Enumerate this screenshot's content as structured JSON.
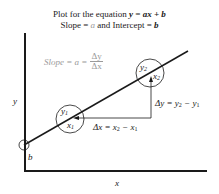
{
  "title": {
    "line1_prefix": "Plot for the equation ",
    "line1_equation": "y = ax + b",
    "line2_prefix": "Slope = ",
    "line2_a": "a",
    "line2_middle": " and Intercept = ",
    "line2_b": "b"
  },
  "slope_label": {
    "prefix": "Slope = a =",
    "numerator": "Δy",
    "denominator": "Δx"
  },
  "axes": {
    "x_label": "x",
    "y_label": "y"
  },
  "points": {
    "p1": {
      "y": "y",
      "y_sub": "1",
      "x": "x",
      "x_sub": "1"
    },
    "p2": {
      "y": "y",
      "y_sub": "2",
      "x": "x",
      "x_sub": "2"
    }
  },
  "intercept_label": "b",
  "delta_x": {
    "lhs": "Δx = x",
    "sub2": "2",
    "mid": " − x",
    "sub1": "1"
  },
  "delta_y": {
    "lhs": "Δy = y",
    "sub2": "2",
    "mid": " − y",
    "sub1": "1"
  },
  "colors": {
    "ink": "#1a1a1a",
    "gray_text": "#9a9a9a"
  }
}
